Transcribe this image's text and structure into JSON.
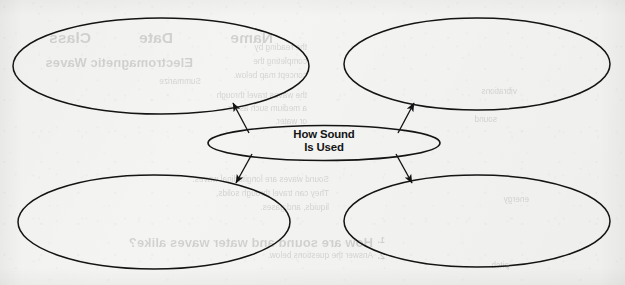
{
  "document": {
    "type": "graphic-organizer-worksheet",
    "background_color": "#f4f4f2",
    "ink_color": "#141414"
  },
  "diagram": {
    "kind": "concept-web",
    "center": {
      "id": "center",
      "label_line_1": "How Sound",
      "label_line_2": "Is Used",
      "label_full": "How Sound Is Used",
      "shape": "ellipse",
      "filled": false
    },
    "branches": [
      {
        "id": "top-left",
        "label": "",
        "shape": "ellipse",
        "filled": false,
        "position": "top-left"
      },
      {
        "id": "top-right",
        "label": "",
        "shape": "ellipse",
        "filled": false,
        "position": "top-right"
      },
      {
        "id": "bottom-left",
        "label": "",
        "shape": "ellipse",
        "filled": false,
        "position": "bottom-left"
      },
      {
        "id": "bottom-right",
        "label": "",
        "shape": "ellipse",
        "filled": false,
        "position": "bottom-right"
      }
    ],
    "connectors": [
      {
        "id": "arrow-to-top-left",
        "from": "center",
        "to": "top-left",
        "arrowhead": "filled-triangle",
        "direction": "up-left"
      },
      {
        "id": "arrow-to-top-right",
        "from": "center",
        "to": "top-right",
        "arrowhead": "filled-triangle",
        "direction": "up-right"
      },
      {
        "id": "arrow-to-bottom-left",
        "from": "center",
        "to": "bottom-left",
        "arrowhead": "filled-triangle",
        "direction": "down-left"
      },
      {
        "id": "arrow-to-bottom-right",
        "from": "center",
        "to": "bottom-right",
        "arrowhead": "filled-triangle",
        "direction": "down-right"
      }
    ]
  },
  "bleed_through": {
    "description": "Faint mirrored text showing through from the reverse side of the page",
    "lines": [
      {
        "id": "b1",
        "text": "Electromagnetic Waves",
        "x": 432,
        "y": 56,
        "style": "bleed-sub"
      },
      {
        "id": "b2",
        "text": "Name",
        "x": 352,
        "y": 30,
        "style": "bleed-head"
      },
      {
        "id": "b3",
        "text": "Date",
        "x": 452,
        "y": 30,
        "style": "bleed-head"
      },
      {
        "id": "b4",
        "text": "Class",
        "x": 534,
        "y": 30,
        "style": "bleed-head"
      },
      {
        "id": "b5",
        "text": "Summarize",
        "x": 424,
        "y": 78,
        "style": "bleed-body"
      },
      {
        "id": "b6",
        "text": "the reading by",
        "x": 318,
        "y": 44,
        "style": "bleed-body"
      },
      {
        "id": "b7",
        "text": "completing the",
        "x": 318,
        "y": 58,
        "style": "bleed-body"
      },
      {
        "id": "b8",
        "text": "concept map below.",
        "x": 318,
        "y": 72,
        "style": "bleed-body"
      },
      {
        "id": "b9",
        "text": "the waves travel through",
        "x": 318,
        "y": 92,
        "style": "bleed-body"
      },
      {
        "id": "b10",
        "text": "a medium such as air",
        "x": 318,
        "y": 105,
        "style": "bleed-body"
      },
      {
        "id": "b11",
        "text": "or water.",
        "x": 318,
        "y": 118,
        "style": "bleed-body"
      },
      {
        "id": "b12",
        "text": "How are sound and water waves alike?",
        "x": 252,
        "y": 236,
        "style": "bleed-sub"
      },
      {
        "id": "b13",
        "text": "Answer the questions below.",
        "x": 252,
        "y": 252,
        "style": "bleed-body"
      },
      {
        "id": "b14",
        "text": "Sound waves are longitudinal waves.",
        "x": 296,
        "y": 176,
        "style": "bleed-body"
      },
      {
        "id": "b15",
        "text": "They can travel through solids,",
        "x": 296,
        "y": 190,
        "style": "bleed-body"
      },
      {
        "id": "b16",
        "text": "liquids, and gases.",
        "x": 296,
        "y": 204,
        "style": "bleed-body"
      },
      {
        "id": "b17",
        "text": "1.",
        "x": 240,
        "y": 236,
        "style": "bleed-qnum"
      },
      {
        "id": "b18",
        "text": "2.",
        "x": 240,
        "y": 252,
        "style": "bleed-qnum"
      },
      {
        "id": "b19",
        "text": "vibrations",
        "x": 108,
        "y": 88,
        "style": "bleed-body"
      },
      {
        "id": "b20",
        "text": "sound",
        "x": 128,
        "y": 116,
        "style": "bleed-body"
      },
      {
        "id": "b21",
        "text": "energy",
        "x": 96,
        "y": 196,
        "style": "bleed-body"
      },
      {
        "id": "b22",
        "text": "pitch",
        "x": 116,
        "y": 262,
        "style": "bleed-body"
      }
    ]
  }
}
